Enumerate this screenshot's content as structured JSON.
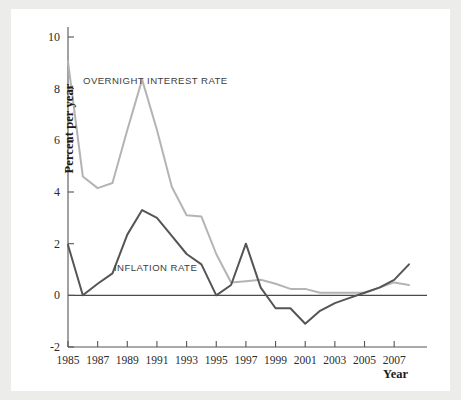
{
  "figure": {
    "panel_background": "#ffffff",
    "outer_background": "#ececeb",
    "axis_label_y": "Percent per year",
    "axis_label_x": "Year"
  },
  "annotations": {
    "overnight_label": "OVERNIGHT INTEREST RATE",
    "inflation_label": "INFLATION RATE"
  },
  "chart_data": {
    "type": "line",
    "title": "",
    "xlabel": "Year",
    "ylabel": "Percent per year",
    "xlim": [
      1985,
      2008
    ],
    "ylim": [
      -2,
      10
    ],
    "yticks": [
      -2,
      0,
      2,
      4,
      6,
      8,
      10
    ],
    "ytick_labels": [
      "-2",
      "0",
      "2",
      "4",
      "6",
      "8",
      "10"
    ],
    "xticks": [
      1985,
      1987,
      1989,
      1991,
      1993,
      1995,
      1997,
      1999,
      2001,
      2003,
      2005,
      2007
    ],
    "xtick_labels": [
      "1985",
      "1987",
      "1989",
      "1991",
      "1993",
      "1995",
      "1997",
      "1999",
      "2001",
      "2003",
      "2005",
      "2007"
    ],
    "grid": false,
    "legend": "inline-annotations",
    "zero_line": 0,
    "x": [
      1985,
      1986,
      1987,
      1988,
      1989,
      1990,
      1991,
      1992,
      1993,
      1994,
      1995,
      1996,
      1997,
      1998,
      1999,
      2000,
      2001,
      2002,
      2003,
      2004,
      2005,
      2006,
      2007,
      2008
    ],
    "series": [
      {
        "name": "OVERNIGHT INTEREST RATE",
        "color": "#b4b4b4",
        "width": 2.0,
        "values": [
          9.05,
          4.6,
          4.15,
          4.35,
          6.4,
          8.35,
          6.4,
          4.2,
          3.1,
          3.05,
          1.6,
          0.5,
          0.55,
          0.6,
          0.45,
          0.25,
          0.25,
          0.1,
          0.1,
          0.1,
          0.1,
          0.3,
          0.5,
          0.4
        ]
      },
      {
        "name": "INFLATION RATE",
        "color": "#555555",
        "width": 2.0,
        "values": [
          1.95,
          0.0,
          0.45,
          0.85,
          2.35,
          3.3,
          3.0,
          2.3,
          1.6,
          1.2,
          0.0,
          0.4,
          2.0,
          0.3,
          -0.5,
          -0.5,
          -1.1,
          -0.6,
          -0.3,
          -0.1,
          0.1,
          0.3,
          0.6,
          1.2
        ]
      }
    ]
  }
}
